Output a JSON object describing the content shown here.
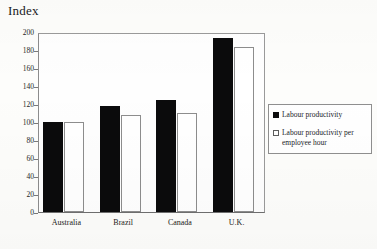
{
  "chart_data": {
    "type": "bar",
    "title": "Index",
    "xlabel": "",
    "ylabel": "Index",
    "ylim": [
      0,
      200
    ],
    "yticks": [
      0,
      20,
      40,
      60,
      80,
      100,
      120,
      140,
      160,
      180,
      200
    ],
    "grid": false,
    "legend_position": "right",
    "categories": [
      "Australia",
      "Brazil",
      "Canada",
      "U.K."
    ],
    "series": [
      {
        "name": "Labour productivity",
        "color": "#0b0b0c",
        "values": [
          100,
          118,
          125,
          193
        ]
      },
      {
        "name": "Labour productivity per employee hour",
        "color": "#ffffff",
        "values": [
          100,
          108,
          110,
          183
        ]
      }
    ]
  },
  "legend": {
    "entries": [
      {
        "label": "Labour productivity",
        "swatch": "filled-square-icon"
      },
      {
        "label": "Labour productivity per employee hour",
        "swatch": "open-square-icon"
      }
    ]
  },
  "axis": {
    "y_tick_labels": [
      "200",
      "180",
      "160",
      "140",
      "120",
      "100",
      "80",
      "60",
      "40",
      "20",
      "0"
    ]
  }
}
